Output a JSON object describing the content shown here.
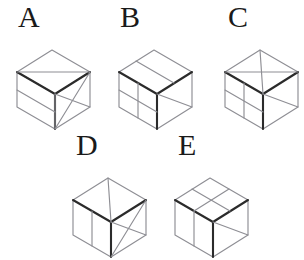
{
  "page": {
    "background_color": "#ffffff",
    "width": 294,
    "height": 249,
    "line_color_dark": "#2b2b2b",
    "line_color_light": "#8e8e94"
  },
  "figures": [
    {
      "id": "A",
      "label": "A",
      "label_x": 18,
      "label_y": 2,
      "origin_x": 14,
      "origin_y": 36,
      "description": "Isometric cube: top face split by a diagonal into triangles; left face split by one horizontal band; right face marked with crossing diagonals forming an X."
    },
    {
      "id": "B",
      "label": "B",
      "label_x": 120,
      "label_y": 2,
      "origin_x": 116,
      "origin_y": 36,
      "description": "Isometric cube: top face split by one line parallel to an edge; left face divided into a 2x2 grid; right face with a single diagonal."
    },
    {
      "id": "C",
      "label": "C",
      "label_x": 228,
      "label_y": 2,
      "origin_x": 222,
      "origin_y": 36,
      "description": "Isometric cube clipped at right image edge: top face crossed by two lines forming an X; left face divided into a 2x2 grid; right face with a single diagonal."
    },
    {
      "id": "D",
      "label": "D",
      "label_x": 76,
      "label_y": 130,
      "origin_x": 70,
      "origin_y": 164,
      "description": "Isometric cube clipped at bottom image edge: top face with a vertical split; left face with one vertical line; right face with crossing diagonals."
    },
    {
      "id": "E",
      "label": "E",
      "label_x": 178,
      "label_y": 130,
      "origin_x": 172,
      "origin_y": 164,
      "description": "Isometric cube clipped at bottom image edge: top face divided into four quadrants; left face with one vertical line; right face with a single diagonal."
    }
  ]
}
